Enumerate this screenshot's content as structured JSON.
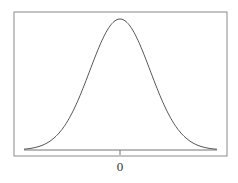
{
  "chart_data": {
    "type": "line",
    "title": "",
    "xlabel": "",
    "ylabel": "",
    "x_ticks": [
      "0"
    ],
    "series": [
      {
        "name": "normal density",
        "mean": 0,
        "std": 1,
        "x": [
          -3,
          -2.5,
          -2,
          -1.5,
          -1,
          -0.5,
          0,
          0.5,
          1,
          1.5,
          2,
          2.5,
          3
        ],
        "values": [
          0.0044,
          0.0175,
          0.054,
          0.1295,
          0.242,
          0.3521,
          0.3989,
          0.3521,
          0.242,
          0.1295,
          0.054,
          0.0175,
          0.0044
        ]
      }
    ],
    "grid": false,
    "legend": null
  },
  "axis": {
    "tick_label": "0"
  },
  "colors": {
    "frame": "#888888",
    "curve": "#555555",
    "baseline": "#777777"
  }
}
